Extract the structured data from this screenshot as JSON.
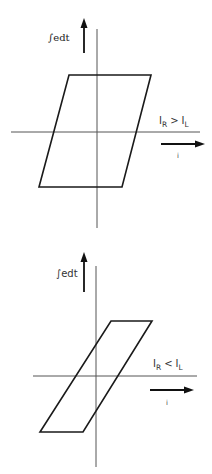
{
  "diagrams": [
    {
      "name": "hysteresis-loop-IR-greater-IL",
      "y_label": "∫edt",
      "x_label": "i",
      "condition": {
        "left": "I",
        "left_sub": "R",
        "op": ">",
        "right": "I",
        "right_sub": "L"
      },
      "loop_shape": "wide parallelogram, slight right lean"
    },
    {
      "name": "hysteresis-loop-IR-less-IL",
      "y_label": "∫edt",
      "x_label": "i",
      "condition": {
        "left": "I",
        "left_sub": "R",
        "op": "<",
        "right": "I",
        "right_sub": "L"
      },
      "loop_shape": "narrow parallelogram, strong right lean"
    }
  ],
  "colors": {
    "background": "#ffffff",
    "line": "#1a1a1a",
    "axis": "#555555"
  }
}
